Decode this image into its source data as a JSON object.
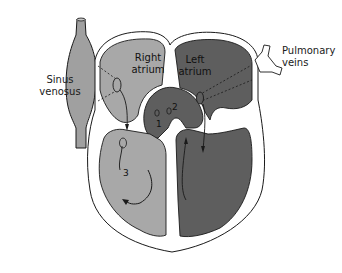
{
  "diagram": {
    "labels": {
      "sinus_venosus_line1": "Sinus",
      "sinus_venosus_line2": "venosus",
      "right_atrium_line1": "Right",
      "right_atrium_line2": "atrium",
      "left_atrium_line1": "Left",
      "left_atrium_line2": "atrium",
      "pulmonary_veins_line1": "Pulmonary",
      "pulmonary_veins_line2": "veins"
    },
    "markers": {
      "marker_1": "1",
      "marker_2": "2",
      "marker_3": "3"
    },
    "colors": {
      "right_side_fill": "#a8a8a8",
      "left_side_fill": "#5e5e5e",
      "vessel_fill": "#a0a0a0",
      "wall_outline": "#1a1a1a",
      "background": "#ffffff"
    }
  }
}
